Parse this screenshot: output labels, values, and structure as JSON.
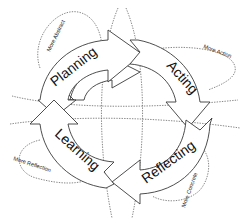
{
  "diagram": {
    "type": "cycle",
    "stages": [
      {
        "id": "planning",
        "label": "Planning"
      },
      {
        "id": "acting",
        "label": "Acting"
      },
      {
        "id": "reflecting",
        "label": "Reflecting"
      },
      {
        "id": "learning",
        "label": "Learning"
      }
    ],
    "flow": [
      "Planning",
      "Acting",
      "Reflecting",
      "Learning",
      "Planning"
    ],
    "axis_labels": {
      "top_left": "More Abstract",
      "top_right": "More Action",
      "bottom_left": "More Reflection",
      "bottom_right": "More Concrete"
    },
    "colors": {
      "arrow_fill": "#ffffff",
      "arrow_stroke": "#3a3a3a",
      "dotted_line": "#6a6a6a",
      "text": "#111111"
    }
  }
}
